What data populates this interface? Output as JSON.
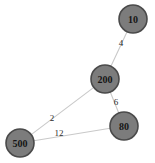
{
  "diagram": {
    "type": "weighted-graph",
    "title": "",
    "background_color": "#ffffff",
    "node_fill_color": "#7c7c7c",
    "node_stroke_color": "#4a4a4a",
    "node_label_color": "#151515",
    "edge_color": "#c9c9c9",
    "edge_label_color": "#2b2b2b",
    "node_radius": 14,
    "node_stroke_width": 1.6,
    "edge_width": 1.1,
    "node_label_font_size": 10,
    "edge_label_font_size": 9,
    "nodes": [
      {
        "id": "10",
        "label": "10",
        "x": 133,
        "y": 19
      },
      {
        "id": "200",
        "label": "200",
        "x": 105,
        "y": 79
      },
      {
        "id": "80",
        "label": "80",
        "x": 124,
        "y": 126
      },
      {
        "id": "500",
        "label": "500",
        "x": 20,
        "y": 143
      }
    ],
    "edges": [
      {
        "source": "200",
        "target": "10",
        "weight": "4",
        "label_x": 121,
        "label_y": 43
      },
      {
        "source": "200",
        "target": "80",
        "weight": "6",
        "label_x": 116,
        "label_y": 102
      },
      {
        "source": "200",
        "target": "500",
        "weight": "2",
        "label_x": 52,
        "label_y": 118
      },
      {
        "source": "500",
        "target": "80",
        "weight": "12",
        "label_x": 59,
        "label_y": 133
      }
    ]
  }
}
